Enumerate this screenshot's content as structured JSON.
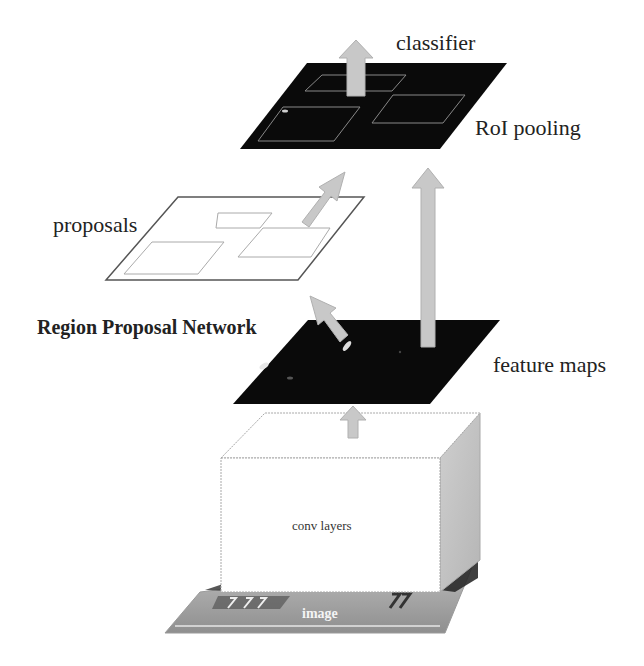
{
  "diagram": {
    "labels": {
      "classifier": "classifier",
      "roi_pooling": "RoI pooling",
      "proposals": "proposals",
      "rpn": "Region Proposal Network",
      "feature_maps": "feature maps",
      "conv_layers": "conv layers",
      "image": "image"
    },
    "nodes": [
      {
        "id": "image",
        "label": "image",
        "shape": "photo-plane"
      },
      {
        "id": "conv_layers",
        "label": "conv layers",
        "shape": "3d-box"
      },
      {
        "id": "feature_maps",
        "label": "feature maps",
        "shape": "dark-plane"
      },
      {
        "id": "proposals",
        "label": "proposals",
        "shape": "white-plane-with-boxes"
      },
      {
        "id": "roi_pooling",
        "label": "RoI pooling",
        "shape": "dark-plane-with-boxes"
      },
      {
        "id": "classifier",
        "label": "classifier",
        "shape": "arrow-output"
      }
    ],
    "edges": [
      {
        "from": "conv_layers",
        "to": "feature_maps"
      },
      {
        "from": "feature_maps",
        "to": "proposals",
        "label": "Region Proposal Network"
      },
      {
        "from": "feature_maps",
        "to": "roi_pooling"
      },
      {
        "from": "proposals",
        "to": "roi_pooling"
      },
      {
        "from": "roi_pooling",
        "to": "classifier"
      }
    ],
    "colors": {
      "arrow_fill": "#c8c8c8",
      "arrow_stroke": "#b0b0b0",
      "dark_plane": "#0a0a0a",
      "box_side": "#bdbdbd",
      "outline": "#555555"
    }
  }
}
